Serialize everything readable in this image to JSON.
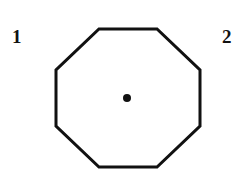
{
  "labels": {
    "left": "1",
    "right": "2"
  },
  "shape": {
    "type": "octagon",
    "stroke_color": "#111111",
    "fill_color": "#ffffff",
    "center_dot_color": "#111111"
  }
}
